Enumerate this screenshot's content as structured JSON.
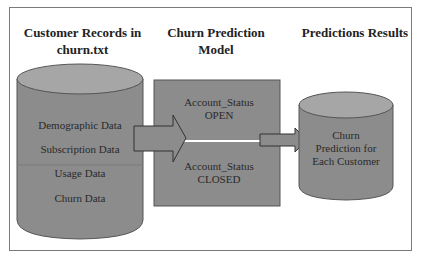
{
  "diagram": {
    "sections": [
      {
        "heading_line1": "Customer Records in",
        "heading_line2": "churn.txt",
        "shape": "cylinder",
        "items": [
          "Demographic Data",
          "Subscription Data",
          "Usage Data",
          "Churn Data"
        ]
      },
      {
        "heading_line1": "Churn Prediction",
        "heading_line2": "Model",
        "shape": "rectangle",
        "items": [
          {
            "line1": "Account_Status",
            "line2": "OPEN"
          },
          {
            "line1": "Account_Status",
            "line2": "CLOSED"
          }
        ]
      },
      {
        "heading_line1": "Predictions Results",
        "shape": "cylinder",
        "items": [
          "Churn",
          "Prediction for",
          "Each Customer"
        ]
      }
    ],
    "arrows": [
      {
        "from": "customer-records",
        "to": "churn-model"
      },
      {
        "from": "churn-model",
        "to": "prediction-results"
      }
    ],
    "colors": {
      "shape_fill": "#8c8c8c",
      "shape_top": "#a6a6a6",
      "outline": "#555555",
      "frame": "#7a7a7a"
    }
  }
}
